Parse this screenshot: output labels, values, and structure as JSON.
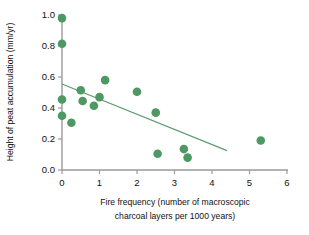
{
  "chart_data": {
    "type": "scatter",
    "title": "",
    "xlabel": "Fire frequency (number of macroscopic charcoal layers per 1000 years)",
    "xlabel_line1": "Fire frequency (number of macroscopic",
    "xlabel_line2": "charcoal layers per 1000 years)",
    "ylabel": "Height of peat accumulation (mm/yr)",
    "xlim": [
      0,
      6
    ],
    "ylim": [
      0.0,
      1.0
    ],
    "grid": false,
    "legend": null,
    "marker_color": "#4e9963",
    "trendline_color": "#5b9b6d",
    "axis_color": "#9a9a9a",
    "xticks": [
      0,
      1,
      2,
      3,
      4,
      5,
      6
    ],
    "xtick_labels": [
      "0",
      "1",
      "2",
      "3",
      "4",
      "5",
      "6"
    ],
    "yticks": [
      0.0,
      0.2,
      0.4,
      0.6,
      0.8,
      1.0
    ],
    "ytick_labels": [
      "0.0",
      "0.2",
      "0.4",
      "0.6",
      "0.8",
      "1.0"
    ],
    "points": [
      {
        "x": 0.0,
        "y": 0.98
      },
      {
        "x": 0.0,
        "y": 0.815
      },
      {
        "x": 0.0,
        "y": 0.455
      },
      {
        "x": 0.0,
        "y": 0.35
      },
      {
        "x": 0.25,
        "y": 0.305
      },
      {
        "x": 0.5,
        "y": 0.515
      },
      {
        "x": 0.55,
        "y": 0.445
      },
      {
        "x": 0.85,
        "y": 0.415
      },
      {
        "x": 1.0,
        "y": 0.47
      },
      {
        "x": 1.15,
        "y": 0.58
      },
      {
        "x": 2.0,
        "y": 0.505
      },
      {
        "x": 2.5,
        "y": 0.37
      },
      {
        "x": 2.55,
        "y": 0.105
      },
      {
        "x": 3.25,
        "y": 0.135
      },
      {
        "x": 3.35,
        "y": 0.08
      },
      {
        "x": 5.3,
        "y": 0.19
      }
    ],
    "trendline": {
      "x0": 0.0,
      "y0": 0.555,
      "x1": 4.4,
      "y1": 0.125
    }
  }
}
